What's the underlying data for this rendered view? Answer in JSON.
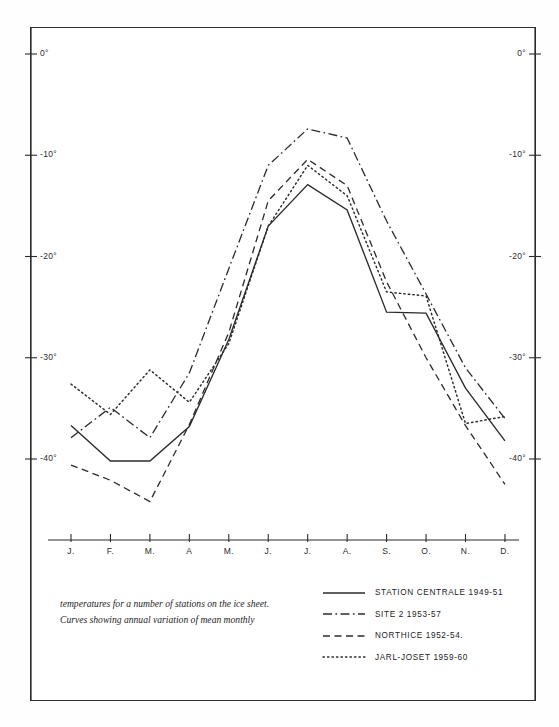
{
  "caption": {
    "line1": "temperatures for a number of stations on the ice sheet.",
    "line2": "Curves showing annual variation of mean monthly"
  },
  "legend": {
    "items": [
      {
        "label": "STATION CENTRALE 1949-51",
        "style": "solid",
        "icon": "solid-line-icon"
      },
      {
        "label": "SITE 2  1953-57",
        "style": "dashdot",
        "icon": "dash-dot-line-icon"
      },
      {
        "label": "NORTHICE 1952-54.",
        "style": "dashed",
        "icon": "dashed-line-icon"
      },
      {
        "label": "JARL-JOSET 1959-60",
        "style": "dotted",
        "icon": "dotted-line-icon"
      }
    ]
  },
  "axes": {
    "y_left_labels": [
      "0°",
      "-10°",
      "-20°",
      "-30°",
      "-40°"
    ],
    "y_right_labels": [
      "0°",
      "-10°",
      "-20°",
      "-30°",
      "-40°"
    ],
    "x_labels": [
      "J.",
      "F.",
      "M.",
      "A",
      "M.",
      "J.",
      "J.",
      "A.",
      "S.",
      "O.",
      "N.",
      "D."
    ]
  },
  "colors": {
    "ink": "#2b2b2b",
    "frame": "#2e2e2e",
    "paper": "#ffffff"
  },
  "chart_data": {
    "type": "line",
    "xlabel": "",
    "ylabel": "",
    "categories": [
      "J.",
      "F.",
      "M.",
      "A",
      "M.",
      "J.",
      "J.",
      "A.",
      "S.",
      "O.",
      "N.",
      "D."
    ],
    "ylim": [
      -45,
      0
    ],
    "yticks": [
      0,
      -10,
      -20,
      -30,
      -40
    ],
    "grid": false,
    "legend_position": "bottom-right",
    "series": [
      {
        "name": "STATION CENTRALE 1949-51",
        "style": "solid",
        "values": [
          -36.7,
          -40.2,
          -40.2,
          -36.8,
          -28.2,
          -17.0,
          -12.9,
          -15.4,
          -25.5,
          -25.6,
          -33.0,
          -38.2
        ]
      },
      {
        "name": "SITE 2  1953-57",
        "style": "dashdot",
        "values": [
          -37.9,
          -34.9,
          -37.9,
          -31.5,
          -21.2,
          -11.0,
          -7.4,
          -8.3,
          -16.5,
          -23.7,
          -31.0,
          -36.0
        ]
      },
      {
        "name": "NORTHICE 1952-54.",
        "style": "dashed",
        "values": [
          -40.6,
          -42.1,
          -44.2,
          -36.6,
          -27.5,
          -14.5,
          -10.4,
          -13.0,
          -22.5,
          -30.0,
          -36.7,
          -42.5
        ]
      },
      {
        "name": "JARL-JOSET 1959-60",
        "style": "dotted",
        "values": [
          -32.6,
          -35.6,
          -31.2,
          -34.4,
          -28.6,
          -17.0,
          -11.0,
          -14.0,
          -23.5,
          -23.9,
          -36.5,
          -35.8
        ]
      }
    ]
  }
}
